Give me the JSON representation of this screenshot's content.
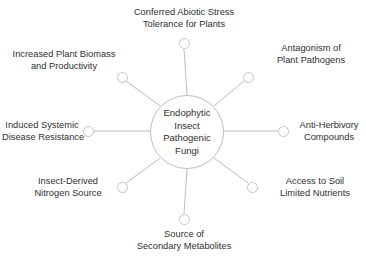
{
  "diagram": {
    "type": "radial-hub-and-spoke",
    "hub": {
      "name": "Endophytic Insect Pathogenic Fungi",
      "lines": [
        "Endophytic",
        "Insect",
        "Pathogenic",
        "Fungi"
      ]
    },
    "colors": {
      "stroke": "#b9bcc0",
      "text": "#2f2f2f",
      "background": "#ffffff"
    },
    "nodes": [
      {
        "id": "conferred-abiotic-stress-tolerance",
        "lines": [
          "Conferred Abiotic Stress",
          "Tolerance for Plants"
        ],
        "position": "top"
      },
      {
        "id": "antagonism-of-plant-pathogens",
        "lines": [
          "Antagonism of",
          "Plant Pathogens"
        ],
        "position": "top-right"
      },
      {
        "id": "anti-herbivory-compounds",
        "lines": [
          "Anti-Herbivory",
          "Compounds"
        ],
        "position": "right"
      },
      {
        "id": "access-to-soil-limited-nutrients",
        "lines": [
          "Access to Soil",
          "Limited Nutrients"
        ],
        "position": "bottom-right"
      },
      {
        "id": "source-of-secondary-metabolites",
        "lines": [
          "Source of",
          "Secondary Metabolites"
        ],
        "position": "bottom"
      },
      {
        "id": "insect-derived-nitrogen-source",
        "lines": [
          "Insect-Derived",
          "Nitrogen Source"
        ],
        "position": "bottom-left"
      },
      {
        "id": "induced-systemic-disease-resistance",
        "lines": [
          "Induced Systemic",
          "Disease Resistance"
        ],
        "position": "left"
      },
      {
        "id": "increased-plant-biomass-productivity",
        "lines": [
          "Increased Plant Biomass",
          "and Productivity"
        ],
        "position": "top-left"
      }
    ]
  }
}
